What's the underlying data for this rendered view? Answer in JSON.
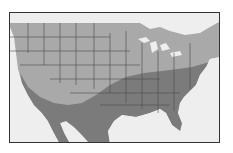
{
  "map": {
    "subject": "Range map of the United States and northern Mexico",
    "regions": [
      {
        "name": "northern-range",
        "color": "#a9a9a9"
      },
      {
        "name": "southern-range",
        "color": "#7b7b7b"
      }
    ],
    "water_color": "#eeeeee",
    "border_color": "#333333",
    "state_line_color": "#4a4a4a"
  }
}
